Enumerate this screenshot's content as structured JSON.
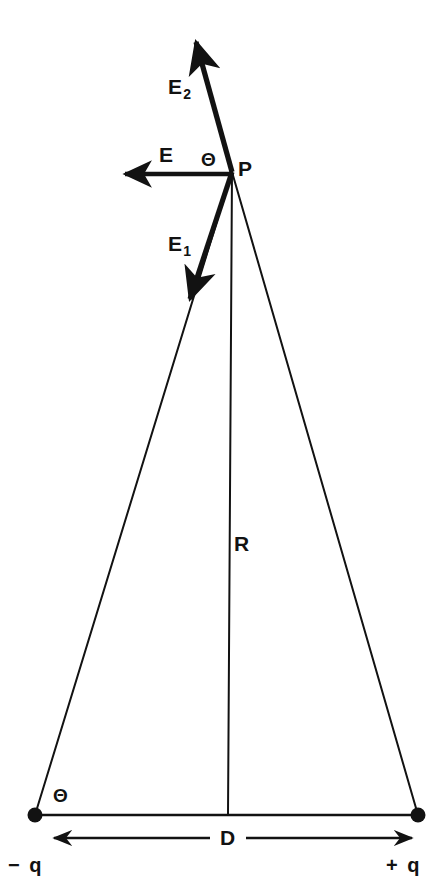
{
  "figure": {
    "name": "electric-dipole-field-diagram",
    "background_color": "#ffffff",
    "stroke_color": "#121212",
    "labels": {
      "field_total": "E",
      "field_from_positive": "E",
      "field_from_positive_subscript": "2",
      "field_from_negative": "E",
      "field_from_negative_subscript": "1",
      "point": "P",
      "distance": "R",
      "separation": "D",
      "angle_at_point": "Θ",
      "angle_at_base": "Θ",
      "charge_negative": "− q",
      "charge_positive": "+ q"
    },
    "geometry": {
      "point_p": {
        "x": 232,
        "y": 172
      },
      "charge_negative_dot": {
        "x": 35,
        "y": 815
      },
      "charge_positive_dot": {
        "x": 418,
        "y": 815
      },
      "baseline_y": 815,
      "vertical_line_x": 228,
      "vector_E_tip": {
        "x": 118,
        "y": 174
      },
      "vector_E2_tip": {
        "x": 193,
        "y": 37
      },
      "vector_E1_tip": {
        "x": 188,
        "y": 305
      },
      "dimension_arrow_y": 838,
      "dot_radius": 7
    }
  }
}
